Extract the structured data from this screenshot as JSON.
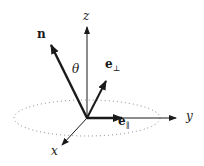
{
  "diagram": {
    "axes": {
      "x": {
        "label": "x"
      },
      "y": {
        "label": "y"
      },
      "z": {
        "label": "z"
      }
    },
    "vectors": {
      "n": {
        "label": "n"
      },
      "e_perp": {
        "base": "e",
        "subscript": "⊥"
      },
      "e_par": {
        "base": "e",
        "subscript": "∥"
      }
    },
    "angle": {
      "label": "θ"
    },
    "colors": {
      "ink": "#1a1a1a",
      "dotted": "#777777"
    }
  }
}
